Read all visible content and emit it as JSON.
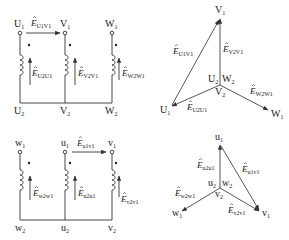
{
  "figure": {
    "top_circuit": {
      "terminals_top": [
        "U",
        "V",
        "W"
      ],
      "terminals_top_sub": [
        "1",
        "1",
        "1"
      ],
      "terminals_bottom": [
        "U",
        "V",
        "W"
      ],
      "terminals_bottom_sub": [
        "2",
        "2",
        "2"
      ],
      "emfs": [
        {
          "base": "E",
          "sub": "U2U1"
        },
        {
          "base": "E",
          "sub": "V2V1"
        },
        {
          "base": "E",
          "sub": "W2W1"
        }
      ],
      "line_emf": {
        "base": "E",
        "sub": "U1V1"
      }
    },
    "top_phasor": {
      "tips": [
        {
          "base": "V",
          "sub": "1"
        },
        {
          "base": "U",
          "sub": "1"
        },
        {
          "base": "W",
          "sub": "1"
        }
      ],
      "center_labels": [
        {
          "base": "U",
          "sub": "2"
        },
        {
          "base": "W",
          "sub": "2"
        },
        {
          "base": "V",
          "sub": "2"
        }
      ],
      "vectors": [
        {
          "base": "E",
          "sub": "U1V1"
        },
        {
          "base": "E",
          "sub": "V2V1"
        },
        {
          "base": "E",
          "sub": "U2U1"
        },
        {
          "base": "E",
          "sub": "W2W1"
        }
      ]
    },
    "bottom_circuit": {
      "terminals_top": [
        "w",
        "u",
        "v"
      ],
      "terminals_top_sub": [
        "1",
        "1",
        "1"
      ],
      "terminals_bottom": [
        "w",
        "u",
        "v"
      ],
      "terminals_bottom_sub": [
        "2",
        "2",
        "2"
      ],
      "emfs": [
        {
          "base": "E",
          "sub": "w2w1"
        },
        {
          "base": "E",
          "sub": "u2u1"
        },
        {
          "base": "E",
          "sub": "v2v1"
        }
      ],
      "line_emf": {
        "base": "E",
        "sub": "u1v1"
      }
    },
    "bottom_phasor": {
      "tips": [
        {
          "base": "u",
          "sub": "1"
        },
        {
          "base": "w",
          "sub": "1"
        },
        {
          "base": "v",
          "sub": "1"
        }
      ],
      "center_labels": [
        {
          "base": "u",
          "sub": "2"
        },
        {
          "base": "w",
          "sub": "2"
        },
        {
          "base": "v",
          "sub": "2"
        }
      ],
      "vectors": [
        {
          "base": "E",
          "sub": "u2u1"
        },
        {
          "base": "E",
          "sub": "u1v1"
        },
        {
          "base": "E",
          "sub": "w2w1"
        },
        {
          "base": "E",
          "sub": "v2v1"
        }
      ]
    },
    "colors": {
      "line": "#333333",
      "text": "#222222",
      "background": "#ffffff"
    }
  }
}
